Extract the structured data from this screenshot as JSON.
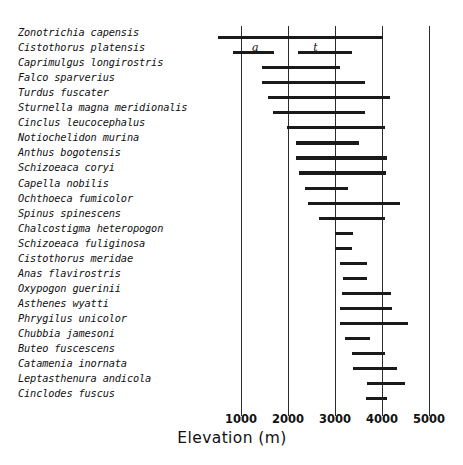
{
  "chart_data": {
    "type": "bar",
    "subtype": "horizontal-range",
    "title": "",
    "xlabel": "Elevation (m)",
    "ylabel": "",
    "xlim": [
      500,
      5000
    ],
    "xticks": [
      1000,
      2000,
      3000,
      4000,
      5000
    ],
    "xticklabels": [
      "1000",
      "2000",
      "3000",
      "4000",
      "5000"
    ],
    "grid": "vertical",
    "legend": "none",
    "annotations": [
      {
        "label": "a",
        "x": 1300,
        "row": 1,
        "note": "letter marking lower (a) segment of Cistothorus platensis"
      },
      {
        "label": "t",
        "x": 2600,
        "row": 1,
        "note": "letter marking upper (t) segment of Cistothorus platensis"
      }
    ],
    "categories": [
      "Zonotrichia capensis",
      "Cistothorus platensis",
      "Caprimulgus longirostris",
      "Falco sparverius",
      "Turdus fuscater",
      "Sturnella magna meridionalis",
      "Cinclus leucocephalus",
      "Notiochelidon murina",
      "Anthus bogotensis",
      "Schizoeaca coryi",
      "Capella nobilis",
      "Ochthoeca fumicolor",
      "Spinus spinescens",
      "Chalcostigma heteropogon",
      "Schizoeaca fuliginosa",
      "Cistothorus meridae",
      "Anas flavirostris",
      "Oxypogon guerinii",
      "Asthenes wyatti",
      "Phrygilus unicolor",
      "Chubbia jamesoni",
      "Buteo fuscescens",
      "Catamenia inornata",
      "Leptasthenura andicola",
      "Cinclodes fuscus"
    ],
    "ranges": [
      {
        "species": "Zonotrichia capensis",
        "segments": [
          [
            510,
            4020
          ]
        ]
      },
      {
        "species": "Cistothorus platensis",
        "segments": [
          [
            830,
            1700
          ],
          [
            2220,
            3360
          ]
        ]
      },
      {
        "species": "Caprimulgus longirostris",
        "segments": [
          [
            1450,
            3100
          ]
        ]
      },
      {
        "species": "Falco sparverius",
        "segments": [
          [
            1450,
            3640
          ]
        ]
      },
      {
        "species": "Turdus fuscater",
        "segments": [
          [
            1570,
            4170
          ]
        ]
      },
      {
        "species": "Sturnella magna meridionalis",
        "segments": [
          [
            1680,
            3640
          ]
        ]
      },
      {
        "species": "Cinclus leucocephalus",
        "segments": [
          [
            1980,
            4060
          ]
        ]
      },
      {
        "species": "Notiochelidon murina",
        "segments": [
          [
            2170,
            3510
          ]
        ]
      },
      {
        "species": "Anthus bogotensis",
        "segments": [
          [
            2170,
            4100
          ]
        ]
      },
      {
        "species": "Schizoeaca coryi",
        "segments": [
          [
            2240,
            4090
          ]
        ]
      },
      {
        "species": "Capella nobilis",
        "segments": [
          [
            2360,
            3280
          ]
        ]
      },
      {
        "species": "Ochthoeca fumicolor",
        "segments": [
          [
            2430,
            4380
          ]
        ]
      },
      {
        "species": "Spinus spinescens",
        "segments": [
          [
            2660,
            4060
          ]
        ]
      },
      {
        "species": "Chalcostigma heteropogon",
        "segments": [
          [
            3000,
            3380
          ]
        ]
      },
      {
        "species": "Schizoeaca fuliginosa",
        "segments": [
          [
            3000,
            3360
          ]
        ]
      },
      {
        "species": "Cistothorus meridae",
        "segments": [
          [
            3110,
            3690
          ]
        ]
      },
      {
        "species": "Anas flavirostris",
        "segments": [
          [
            3170,
            3690
          ]
        ]
      },
      {
        "species": "Oxypogon guerinii",
        "segments": [
          [
            3140,
            4190
          ]
        ]
      },
      {
        "species": "Asthenes wyatti",
        "segments": [
          [
            3110,
            4210
          ]
        ]
      },
      {
        "species": "Phrygilus unicolor",
        "segments": [
          [
            3110,
            4550
          ]
        ]
      },
      {
        "species": "Chubbia jamesoni",
        "segments": [
          [
            3210,
            3740
          ]
        ]
      },
      {
        "species": "Buteo fuscescens",
        "segments": [
          [
            3360,
            4060
          ]
        ]
      },
      {
        "species": "Catamenia inornata",
        "segments": [
          [
            3380,
            4320
          ]
        ]
      },
      {
        "species": "Leptasthenura andicola",
        "segments": [
          [
            3690,
            4490
          ]
        ]
      },
      {
        "species": "Cinclodes fuscus",
        "segments": [
          [
            3650,
            4110
          ]
        ]
      }
    ]
  },
  "axis": {
    "title": "Elevation (m)"
  }
}
